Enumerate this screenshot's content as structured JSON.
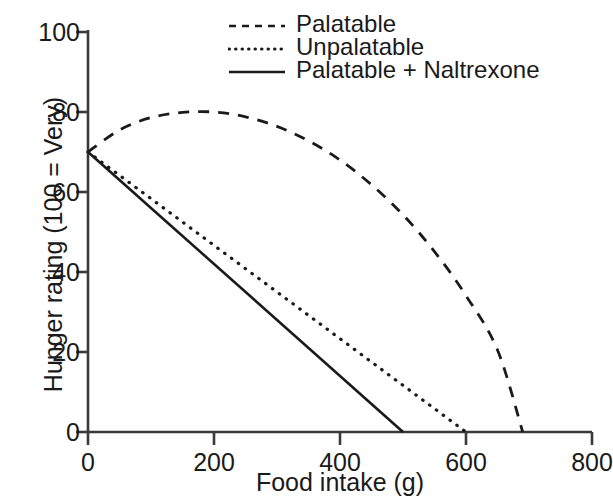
{
  "chart_data": {
    "type": "line",
    "title": "",
    "xlabel": "Food intake (g)",
    "ylabel": "Hunger rating (100 = Very)",
    "xlim": [
      0,
      800
    ],
    "ylim": [
      0,
      100
    ],
    "xticks": [
      "0",
      "200",
      "400",
      "600",
      "800"
    ],
    "xtick_values": [
      0,
      200,
      400,
      600,
      800
    ],
    "yticks": [
      "0",
      "20",
      "40",
      "60",
      "80",
      "100"
    ],
    "ytick_values": [
      0,
      20,
      40,
      60,
      80,
      100
    ],
    "grid": false,
    "legend_position": "top-right",
    "series": [
      {
        "name": "Palatable",
        "style": "dashed",
        "color": "#1a1a1a",
        "x": [
          0,
          50,
          100,
          150,
          200,
          250,
          300,
          350,
          400,
          450,
          500,
          550,
          600,
          650,
          690
        ],
        "values": [
          70,
          75.5,
          78.6,
          79.9,
          80.0,
          78.8,
          76.4,
          72.8,
          68.0,
          61.8,
          54.3,
          45.1,
          34.1,
          20.5,
          0
        ]
      },
      {
        "name": "Unpalatable",
        "style": "dotted",
        "color": "#1a1a1a",
        "x": [
          0,
          600
        ],
        "values": [
          70,
          0
        ]
      },
      {
        "name": "Palatable + Naltrexone",
        "style": "solid",
        "color": "#1a1a1a",
        "x": [
          0,
          500
        ],
        "values": [
          70,
          0
        ]
      }
    ]
  },
  "legend": {
    "items": [
      {
        "label": "Palatable",
        "style": "dashed"
      },
      {
        "label": "Unpalatable",
        "style": "dotted"
      },
      {
        "label": "Palatable + Naltrexone",
        "style": "solid"
      }
    ]
  },
  "axes": {
    "x_title": "Food intake (g)",
    "y_title": "Hunger rating (100 = Very)",
    "x_tick_labels": [
      "0",
      "200",
      "400",
      "600",
      "800"
    ],
    "y_tick_labels": [
      "0",
      "20",
      "40",
      "60",
      "80",
      "100"
    ]
  },
  "colors": {
    "ink": "#1a1a1a",
    "background": "#ffffff"
  }
}
